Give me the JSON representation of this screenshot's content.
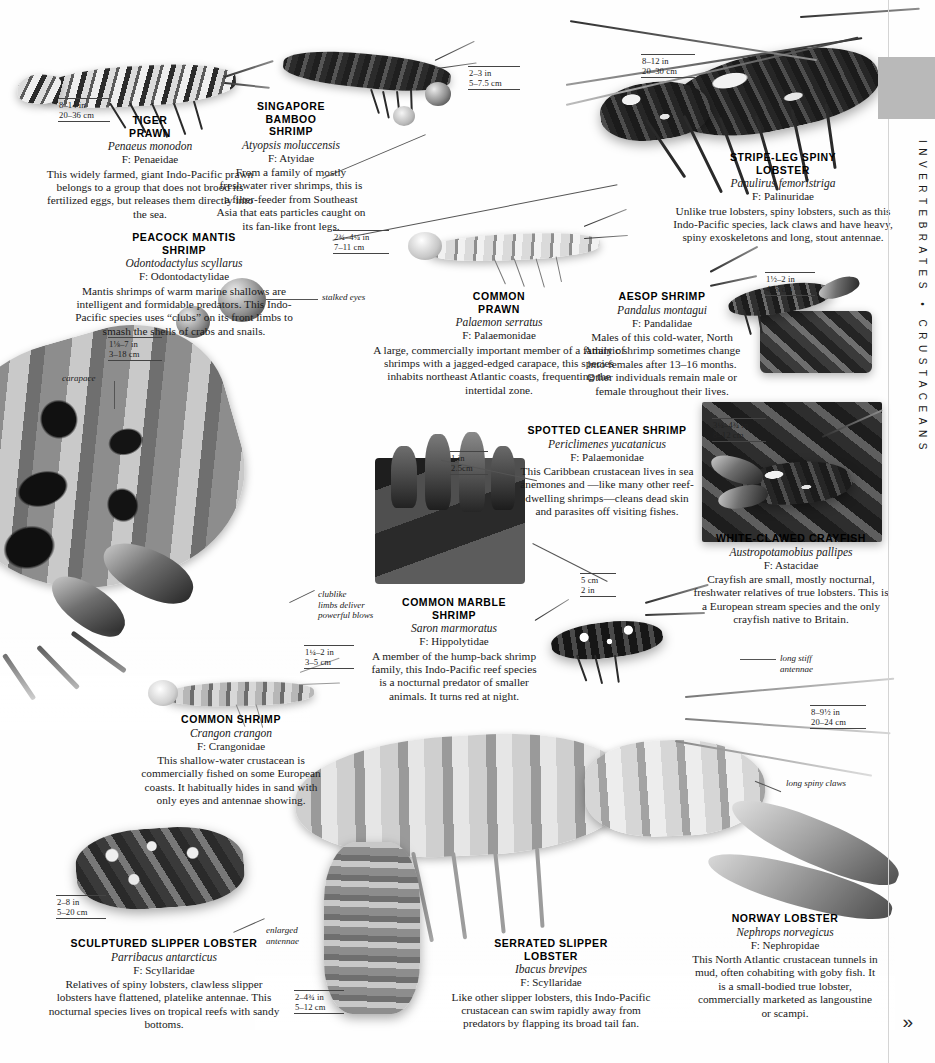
{
  "running_head": "INVERTEBRATES  •  CRUSTACEANS",
  "next_page_chevron": "»",
  "family_prefix": "F:",
  "entries": [
    {
      "id": "tiger-prawn",
      "common_name": "TIGER\nPRAWN",
      "common_name_lines": [
        "TIGER",
        "PRAWN"
      ],
      "scientific_name": "Penaeus monodon",
      "family": "F: Penaeidae",
      "description": "This widely farmed, giant Indo-Pacific prawn belongs to a group that does not brood its fertilized eggs, but releases them directly into the sea.",
      "scale": {
        "imperial": "8–14 in",
        "metric": "20–36 cm"
      }
    },
    {
      "id": "singapore-bamboo-shrimp",
      "common_name_lines": [
        "SINGAPORE",
        "BAMBOO",
        "SHRIMP"
      ],
      "scientific_name": "Atyopsis moluccensis",
      "family": "F: Atyidae",
      "description": "From a family of mostly freshwater river shrimps, this is a filter-feeder from Southeast Asia that eats particles caught on its fan-like front legs.",
      "scale": {
        "imperial": "2–3 in",
        "metric": "5–7.5 cm"
      }
    },
    {
      "id": "stripe-leg-spiny-lobster",
      "common_name_lines": [
        "STRIPE-LEG SPINY",
        "LOBSTER"
      ],
      "scientific_name": "Panulirus femoristriga",
      "family": "F: Palinuridae",
      "description": "Unlike true lobsters, spiny lobsters, such as this Indo-Pacific species, lack claws and have heavy, spiny exoskeletons and long, stout antennae.",
      "scale": {
        "imperial": "8–12 in",
        "metric": "20–30 cm"
      }
    },
    {
      "id": "peacock-mantis-shrimp",
      "common_name_lines": [
        "PEACOCK MANTIS",
        "SHRIMP"
      ],
      "scientific_name": "Odontodactylus scyllarus",
      "family": "F: Odontodactylidae",
      "description": "Mantis shrimps of warm marine shallows are intelligent and formidable predators. This Indo-Pacific species uses “clubs” on its front limbs to smash the shells of crabs and snails.",
      "scale": {
        "imperial": "1⅛–7 in",
        "metric": "3–18 cm"
      }
    },
    {
      "id": "common-prawn",
      "common_name_lines": [
        "COMMON",
        "PRAWN"
      ],
      "scientific_name": "Palaemon serratus",
      "family": "F: Palaemonidae",
      "description": "A large, commercially important member of a family of shrimps with a jagged-edged carapace, this species inhabits northeast Atlantic coasts, frequenting the intertidal zone.",
      "scale": {
        "imperial": "2¾–4¼ in",
        "metric": "7–11 cm"
      }
    },
    {
      "id": "aesop-shrimp",
      "common_name_lines": [
        "AESOP SHRIMP"
      ],
      "scientific_name": "Pandalus montagui",
      "family": "F: Pandalidae",
      "description": "Males of this cold-water, North Atlantic shrimp sometimes change into females after 13–16 months. Other individuals remain male or female throughout their lives.",
      "scale": {
        "imperial": "1½–2 in",
        "metric": "4–5 cm"
      }
    },
    {
      "id": "spotted-cleaner-shrimp",
      "common_name_lines": [
        "SPOTTED CLEANER SHRIMP"
      ],
      "scientific_name": "Periclimenes yucatanicus",
      "family": "F: Palaemonidae",
      "description": "This Caribbean crustacean lives in sea anemones and —like many other reef-dwelling shrimps—cleans dead skin and parasites off visiting fishes.",
      "scale": {
        "imperial": "1 in",
        "metric": "2.5cm"
      }
    },
    {
      "id": "white-clawed-crayfish",
      "common_name_lines": [
        "WHITE-CLAWED CRAYFISH"
      ],
      "scientific_name": "Austropotamobius pallipes",
      "family": "F: Astacidae",
      "description": "Crayfish are small, mostly nocturnal, freshwater relatives of true lobsters. This is a European stream species and the only crayfish native to Britain.",
      "scale": {
        "imperial": "3¼–4¾ in",
        "metric": "8–12 cm"
      }
    },
    {
      "id": "common-marble-shrimp",
      "common_name_lines": [
        "COMMON MARBLE",
        "SHRIMP"
      ],
      "scientific_name": "Saron marmoratus",
      "family": "F: Hippolytidae",
      "description": "A member of the hump-back shrimp family, this Indo-Pacific reef species is a nocturnal predator of smaller animals. It turns red at night.",
      "scale": {
        "imperial": "5 cm",
        "metric": "2 in"
      }
    },
    {
      "id": "common-shrimp",
      "common_name_lines": [
        "COMMON SHRIMP"
      ],
      "scientific_name": "Crangon crangon",
      "family": "F: Crangonidae",
      "description": "This shallow-water crustacean is commercially fished on some European coasts. It habitually hides in sand with only eyes and antennae showing.",
      "scale": {
        "imperial": "1¼–2 in",
        "metric": "3–5 cm"
      }
    },
    {
      "id": "sculptured-slipper-lobster",
      "common_name_lines": [
        "SCULPTURED SLIPPER LOBSTER"
      ],
      "scientific_name": "Parribacus antarcticus",
      "family": "F: Scyllaridae",
      "description": "Relatives of spiny lobsters, clawless slipper lobsters have flattened, platelike antennae. This nocturnal species lives on tropical reefs with sandy bottoms.",
      "scale": {
        "imperial": "2–8 in",
        "metric": "5–20 cm"
      }
    },
    {
      "id": "serrated-slipper-lobster",
      "common_name_lines": [
        "SERRATED SLIPPER",
        "LOBSTER"
      ],
      "scientific_name": "Ibacus brevipes",
      "family": "F: Scyllaridae",
      "description": "Like other slipper lobsters, this Indo-Pacific crustacean can swim rapidly away from predators by flapping its broad tail fan.",
      "scale": {
        "imperial": "2–4¾ in",
        "metric": "5–12 cm"
      }
    },
    {
      "id": "norway-lobster",
      "common_name_lines": [
        "NORWAY LOBSTER"
      ],
      "scientific_name": "Nephrops norvegicus",
      "family": "F: Nephropidae",
      "description": "This North Atlantic crustacean tunnels in mud, often cohabiting with goby fish. It is a small-bodied true lobster, commercially marketed as langoustine or scampi.",
      "scale": {
        "imperial": "8–9½ in",
        "metric": "20–24 cm"
      }
    }
  ],
  "extra_scales": {
    "norway_lobster_extra": {
      "imperial": "5 cm",
      "metric": "2 in"
    }
  },
  "callouts": [
    {
      "id": "stalked-eyes",
      "text": "stalked eyes"
    },
    {
      "id": "carapace",
      "text": "carapace"
    },
    {
      "id": "clublike-limbs",
      "text": "clublike\nlimbs deliver\npowerful blows",
      "lines": [
        "clublike",
        "limbs deliver",
        "powerful blows"
      ]
    },
    {
      "id": "long-stiff-antennae",
      "text": "long stiff\nantennae",
      "lines": [
        "long stiff",
        "antennae"
      ]
    },
    {
      "id": "long-spiny-claws",
      "text": "long spiny claws",
      "lines": [
        "long spiny claws"
      ]
    },
    {
      "id": "enlarged-antennae",
      "text": "enlarged\nantennae",
      "lines": [
        "enlarged",
        "antennae"
      ]
    }
  ],
  "colors": {
    "page_background": "#fefefe",
    "text": "#1a1a1a",
    "rule": "#444444",
    "edge_rule": "#d4d4d4",
    "grey_tab": "#b9b9b9"
  }
}
